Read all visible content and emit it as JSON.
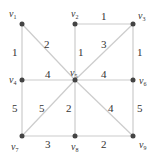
{
  "graph": {
    "vertices": [
      {
        "id": "v1",
        "label": "v",
        "sub": "1",
        "x": 22,
        "y": 24
      },
      {
        "id": "v2",
        "label": "v",
        "sub": "2",
        "x": 75,
        "y": 24
      },
      {
        "id": "v3",
        "label": "v",
        "sub": "3",
        "x": 133,
        "y": 24
      },
      {
        "id": "v4",
        "label": "v",
        "sub": "4",
        "x": 22,
        "y": 80
      },
      {
        "id": "v5",
        "label": "v",
        "sub": "5",
        "x": 75,
        "y": 80
      },
      {
        "id": "v6",
        "label": "v",
        "sub": "6",
        "x": 133,
        "y": 80
      },
      {
        "id": "v7",
        "label": "v",
        "sub": "7",
        "x": 22,
        "y": 136
      },
      {
        "id": "v8",
        "label": "v",
        "sub": "8",
        "x": 75,
        "y": 136
      },
      {
        "id": "v9",
        "label": "v",
        "sub": "9",
        "x": 133,
        "y": 136
      }
    ],
    "edges": [
      {
        "from": "v1",
        "to": "v4",
        "weight": "1"
      },
      {
        "from": "v1",
        "to": "v5",
        "weight": "2"
      },
      {
        "from": "v2",
        "to": "v3",
        "weight": "1"
      },
      {
        "from": "v2",
        "to": "v5",
        "weight": "1"
      },
      {
        "from": "v3",
        "to": "v5",
        "weight": "3"
      },
      {
        "from": "v3",
        "to": "v6",
        "weight": "1"
      },
      {
        "from": "v4",
        "to": "v5",
        "weight": "4"
      },
      {
        "from": "v5",
        "to": "v6",
        "weight": "4"
      },
      {
        "from": "v4",
        "to": "v7",
        "weight": "5"
      },
      {
        "from": "v5",
        "to": "v7",
        "weight": "5"
      },
      {
        "from": "v5",
        "to": "v8",
        "weight": "2"
      },
      {
        "from": "v5",
        "to": "v9",
        "weight": "4"
      },
      {
        "from": "v6",
        "to": "v9",
        "weight": "5"
      },
      {
        "from": "v7",
        "to": "v8",
        "weight": "3"
      },
      {
        "from": "v8",
        "to": "v9",
        "weight": "2"
      }
    ]
  }
}
